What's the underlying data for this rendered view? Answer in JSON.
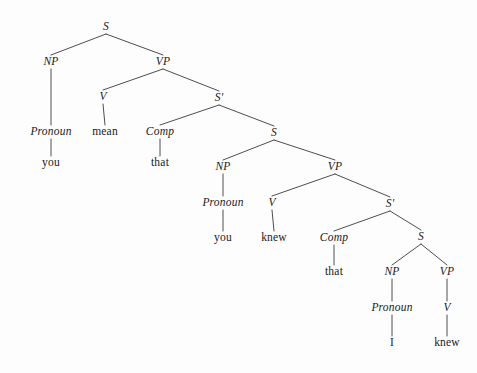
{
  "figure": {
    "kind": "syntax-tree",
    "sentence": "you mean that you knew that I knew",
    "background_color": "#fdfdfd",
    "line_color": "#3a3a3a",
    "text_color": "#1a1a1a",
    "width": 477,
    "height": 373
  },
  "nodes": [
    {
      "id": "n0",
      "label": "S",
      "type": "category",
      "x": 106,
      "y": 27
    },
    {
      "id": "n1",
      "label": "NP",
      "type": "category",
      "x": 51,
      "y": 62
    },
    {
      "id": "n2",
      "label": "VP",
      "type": "category",
      "x": 163,
      "y": 62
    },
    {
      "id": "n3",
      "label": "Pronoun",
      "type": "category",
      "x": 51,
      "y": 132
    },
    {
      "id": "n4",
      "label": "you",
      "type": "word",
      "x": 51,
      "y": 163
    },
    {
      "id": "n5",
      "label": "V",
      "type": "category",
      "x": 103,
      "y": 97
    },
    {
      "id": "n6",
      "label": "mean",
      "type": "word",
      "x": 105,
      "y": 132
    },
    {
      "id": "n7",
      "label": "S'",
      "type": "category",
      "x": 219,
      "y": 98
    },
    {
      "id": "n8",
      "label": "Comp",
      "type": "category",
      "x": 160,
      "y": 132
    },
    {
      "id": "n9",
      "label": "that",
      "type": "word",
      "x": 160,
      "y": 163
    },
    {
      "id": "n10",
      "label": "S",
      "type": "category",
      "x": 274,
      "y": 133
    },
    {
      "id": "n11",
      "label": "NP",
      "type": "category",
      "x": 223,
      "y": 167
    },
    {
      "id": "n12",
      "label": "VP",
      "type": "category",
      "x": 335,
      "y": 167
    },
    {
      "id": "n13",
      "label": "Pronoun",
      "type": "category",
      "x": 223,
      "y": 203
    },
    {
      "id": "n14",
      "label": "you",
      "type": "word",
      "x": 223,
      "y": 238
    },
    {
      "id": "n15",
      "label": "V",
      "type": "category",
      "x": 272,
      "y": 203
    },
    {
      "id": "n16",
      "label": "knew",
      "type": "word",
      "x": 274,
      "y": 238
    },
    {
      "id": "n17",
      "label": "S'",
      "type": "category",
      "x": 390,
      "y": 204
    },
    {
      "id": "n18",
      "label": "Comp",
      "type": "category",
      "x": 334,
      "y": 238
    },
    {
      "id": "n19",
      "label": "that",
      "type": "word",
      "x": 334,
      "y": 272
    },
    {
      "id": "n20",
      "label": "S",
      "type": "category",
      "x": 421,
      "y": 237
    },
    {
      "id": "n21",
      "label": "NP",
      "type": "category",
      "x": 392,
      "y": 272
    },
    {
      "id": "n22",
      "label": "VP",
      "type": "category",
      "x": 447,
      "y": 272
    },
    {
      "id": "n23",
      "label": "Pronoun",
      "type": "category",
      "x": 392,
      "y": 308
    },
    {
      "id": "n24",
      "label": "I",
      "type": "word",
      "x": 392,
      "y": 343
    },
    {
      "id": "n25",
      "label": "V",
      "type": "category",
      "x": 447,
      "y": 308
    },
    {
      "id": "n26",
      "label": "knew",
      "type": "word",
      "x": 447,
      "y": 343
    }
  ],
  "edges": [
    {
      "from": "n0",
      "to": "n1"
    },
    {
      "from": "n0",
      "to": "n2"
    },
    {
      "from": "n1",
      "to": "n3"
    },
    {
      "from": "n3",
      "to": "n4"
    },
    {
      "from": "n2",
      "to": "n5"
    },
    {
      "from": "n5",
      "to": "n6"
    },
    {
      "from": "n2",
      "to": "n7"
    },
    {
      "from": "n7",
      "to": "n8"
    },
    {
      "from": "n8",
      "to": "n9"
    },
    {
      "from": "n7",
      "to": "n10"
    },
    {
      "from": "n10",
      "to": "n11"
    },
    {
      "from": "n10",
      "to": "n12"
    },
    {
      "from": "n11",
      "to": "n13"
    },
    {
      "from": "n13",
      "to": "n14"
    },
    {
      "from": "n12",
      "to": "n15"
    },
    {
      "from": "n15",
      "to": "n16"
    },
    {
      "from": "n12",
      "to": "n17"
    },
    {
      "from": "n17",
      "to": "n18"
    },
    {
      "from": "n18",
      "to": "n19"
    },
    {
      "from": "n17",
      "to": "n20"
    },
    {
      "from": "n20",
      "to": "n21"
    },
    {
      "from": "n20",
      "to": "n22"
    },
    {
      "from": "n21",
      "to": "n23"
    },
    {
      "from": "n23",
      "to": "n24"
    },
    {
      "from": "n22",
      "to": "n25"
    },
    {
      "from": "n25",
      "to": "n26"
    }
  ]
}
